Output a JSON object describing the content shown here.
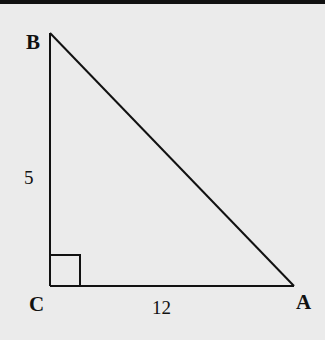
{
  "diagram": {
    "type": "right-triangle",
    "vertices": [
      {
        "label": "B",
        "x": 50,
        "y": 33
      },
      {
        "label": "C",
        "x": 50,
        "y": 286
      },
      {
        "label": "A",
        "x": 294,
        "y": 286
      }
    ],
    "right_angle_at": "C",
    "sides": [
      {
        "between": [
          "B",
          "C"
        ],
        "length_label": "5"
      },
      {
        "between": [
          "C",
          "A"
        ],
        "length_label": "12"
      }
    ],
    "colors": {
      "background": "#ebebeb",
      "stroke": "#111111"
    }
  },
  "labels": {
    "B": "B",
    "C": "C",
    "A": "A",
    "BC": "5",
    "CA": "12"
  }
}
